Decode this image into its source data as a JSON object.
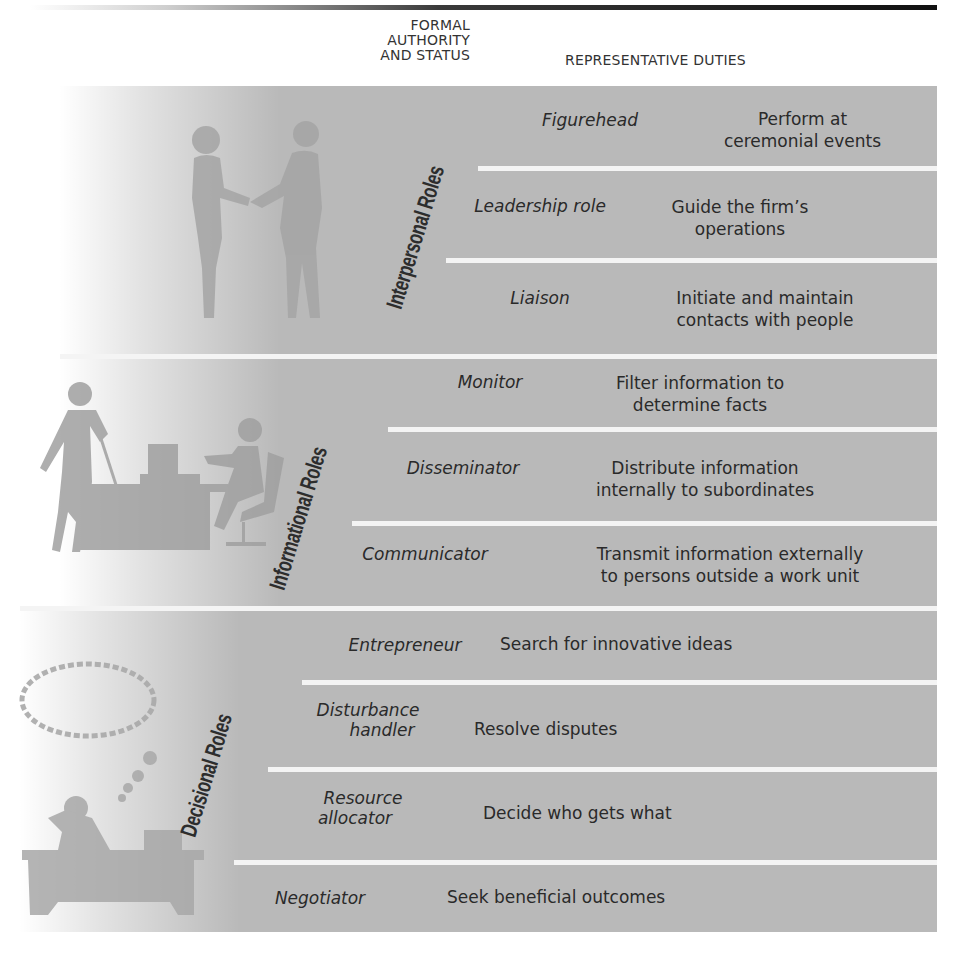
{
  "header": {
    "formal_authority": [
      "FORMAL",
      "AUTHORITY",
      "AND STATUS"
    ],
    "representative_duties": "REPRESENTATIVE DUTIES"
  },
  "colors": {
    "panel": "#b9b9b9",
    "separator": "#f4f4f4",
    "text": "#2a2a2a",
    "top_rule": "#111111"
  },
  "categories": [
    {
      "label": "Interpersonal Roles",
      "illustration": "handshake-figures",
      "roles": [
        {
          "role": "Figurehead",
          "duty": [
            "Perform at",
            "ceremonial events"
          ]
        },
        {
          "role": "Leadership role",
          "duty": [
            "Guide the firm’s",
            "operations"
          ]
        },
        {
          "role": "Liaison",
          "duty": [
            "Initiate and maintain",
            "contacts with people"
          ]
        }
      ]
    },
    {
      "label": "Informational Roles",
      "illustration": "office-monitoring-figures",
      "roles": [
        {
          "role": "Monitor",
          "duty": [
            "Filter information to",
            "determine facts"
          ]
        },
        {
          "role": "Disseminator",
          "duty": [
            "Distribute information",
            "internally to subordinates"
          ]
        },
        {
          "role": "Communicator",
          "duty": [
            "Transmit information externally",
            "to persons outside a work unit"
          ]
        }
      ]
    },
    {
      "label": "Decisional Roles",
      "illustration": "thinking-person-at-desk",
      "roles": [
        {
          "role": "Entrepreneur",
          "duty": [
            "Search for innovative ideas"
          ]
        },
        {
          "role": [
            "Disturbance",
            "handler"
          ],
          "duty": [
            "Resolve disputes"
          ]
        },
        {
          "role": [
            "Resource",
            "allocator"
          ],
          "duty": [
            "Decide who gets what"
          ]
        },
        {
          "role": "Negotiator",
          "duty": [
            "Seek beneficial outcomes"
          ]
        }
      ]
    }
  ]
}
